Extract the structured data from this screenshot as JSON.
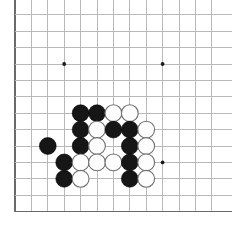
{
  "app": {
    "title": "Go Board Position",
    "description": "Partial view of a 19x19 Go board showing the lower-left corner with a black-and-white stone cluster"
  },
  "board": {
    "background_color": "#ffffff",
    "grid_color": "#b9b9b9",
    "grid_major_color": "#8d8d8d",
    "edge_color": "#6a6a6a",
    "black_stone_color": "#161616",
    "white_stone_color": "#fdfdfd",
    "white_stone_border_color": "#6f6f6f",
    "star_point_color": "#1a1a1a",
    "origin_x": 15,
    "origin_y": -18,
    "spacing": 16.4,
    "columns": 13,
    "rows": 15,
    "stone_radius": 8.4,
    "star_radius": 1.9,
    "left_edge_col": 0,
    "bottom_edge_row": 14,
    "star_points": [
      {
        "col": 3,
        "row": 11,
        "label": "star-3-11"
      },
      {
        "col": 9,
        "row": 11,
        "label": "star-9-11"
      },
      {
        "col": 3,
        "row": 5,
        "label": "star-3-5"
      },
      {
        "col": 9,
        "row": 5,
        "label": "star-9-5"
      }
    ],
    "stones": [
      {
        "col": 4,
        "row": 8,
        "color": "black",
        "label": "black-stone-d8"
      },
      {
        "col": 5,
        "row": 8,
        "color": "black",
        "label": "black-stone-e8"
      },
      {
        "col": 6,
        "row": 8,
        "color": "white",
        "label": "white-stone-f8"
      },
      {
        "col": 7,
        "row": 8,
        "color": "white",
        "label": "white-stone-g8"
      },
      {
        "col": 4,
        "row": 9,
        "color": "black",
        "label": "black-stone-d9"
      },
      {
        "col": 5,
        "row": 9,
        "color": "white",
        "label": "white-stone-e9"
      },
      {
        "col": 6,
        "row": 9,
        "color": "black",
        "label": "black-stone-f9"
      },
      {
        "col": 7,
        "row": 9,
        "color": "black",
        "label": "black-stone-g9"
      },
      {
        "col": 8,
        "row": 9,
        "color": "white",
        "label": "white-stone-h9"
      },
      {
        "col": 2,
        "row": 10,
        "color": "black",
        "label": "black-stone-b10"
      },
      {
        "col": 4,
        "row": 10,
        "color": "black",
        "label": "black-stone-d10"
      },
      {
        "col": 5,
        "row": 10,
        "color": "white",
        "label": "white-stone-e10"
      },
      {
        "col": 7,
        "row": 10,
        "color": "black",
        "label": "black-stone-g10"
      },
      {
        "col": 8,
        "row": 10,
        "color": "white",
        "label": "white-stone-h10"
      },
      {
        "col": 3,
        "row": 11,
        "color": "black",
        "label": "black-stone-c11"
      },
      {
        "col": 4,
        "row": 11,
        "color": "white",
        "label": "white-stone-d11"
      },
      {
        "col": 5,
        "row": 11,
        "color": "white",
        "label": "white-stone-e11"
      },
      {
        "col": 6,
        "row": 11,
        "color": "white",
        "label": "white-stone-f11"
      },
      {
        "col": 7,
        "row": 11,
        "color": "black",
        "label": "black-stone-g11"
      },
      {
        "col": 8,
        "row": 11,
        "color": "white",
        "label": "white-stone-h11"
      },
      {
        "col": 3,
        "row": 12,
        "color": "black",
        "label": "black-stone-c12"
      },
      {
        "col": 4,
        "row": 12,
        "color": "white",
        "label": "white-stone-d12"
      },
      {
        "col": 7,
        "row": 12,
        "color": "black",
        "label": "black-stone-g12"
      },
      {
        "col": 8,
        "row": 12,
        "color": "white",
        "label": "white-stone-h12"
      }
    ]
  }
}
